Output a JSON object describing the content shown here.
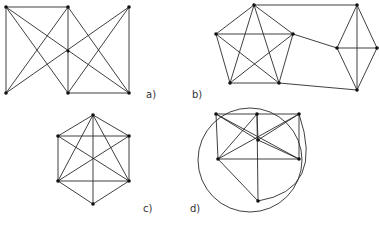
{
  "figure": {
    "panels": [
      {
        "id": "a",
        "label": "a)",
        "label_pos": [
          146,
          98
        ],
        "vertices": [
          [
            6,
            7
          ],
          [
            68,
            7
          ],
          [
            129,
            7
          ],
          [
            6,
            93
          ],
          [
            68,
            93
          ],
          [
            129,
            93
          ]
        ],
        "edges": [
          [
            0,
            1
          ],
          [
            0,
            3
          ],
          [
            0,
            4
          ],
          [
            0,
            5
          ],
          [
            1,
            3
          ],
          [
            1,
            4
          ],
          [
            1,
            5
          ],
          [
            2,
            3
          ],
          [
            2,
            4
          ],
          [
            2,
            5
          ],
          [
            4,
            5
          ]
        ],
        "extra_points": [
          [
            68,
            51
          ]
        ]
      },
      {
        "id": "b",
        "label": "b)",
        "label_pos": [
          192,
          98
        ],
        "vertices": [
          [
            254,
            5
          ],
          [
            216,
            34
          ],
          [
            293,
            34
          ],
          [
            230,
            83
          ],
          [
            279,
            83
          ],
          [
            357,
            5
          ],
          [
            337,
            48
          ],
          [
            377,
            48
          ],
          [
            357,
            90
          ]
        ],
        "edges": [
          [
            0,
            1
          ],
          [
            0,
            2
          ],
          [
            0,
            3
          ],
          [
            0,
            4
          ],
          [
            1,
            2
          ],
          [
            1,
            3
          ],
          [
            1,
            4
          ],
          [
            2,
            3
          ],
          [
            2,
            4
          ],
          [
            3,
            4
          ],
          [
            5,
            6
          ],
          [
            5,
            7
          ],
          [
            5,
            8
          ],
          [
            6,
            7
          ],
          [
            6,
            8
          ],
          [
            7,
            8
          ],
          [
            0,
            5
          ],
          [
            2,
            6
          ],
          [
            4,
            8
          ]
        ]
      },
      {
        "id": "c",
        "label": "c)",
        "label_pos": [
          143,
          212
        ],
        "vertices": [
          [
            93,
            115
          ],
          [
            58,
            136
          ],
          [
            129,
            136
          ],
          [
            58,
            181
          ],
          [
            129,
            181
          ],
          [
            93,
            204
          ]
        ],
        "edges": [
          [
            0,
            1
          ],
          [
            0,
            2
          ],
          [
            0,
            3
          ],
          [
            0,
            4
          ],
          [
            0,
            5
          ],
          [
            1,
            2
          ],
          [
            1,
            3
          ],
          [
            1,
            4
          ],
          [
            2,
            3
          ],
          [
            2,
            4
          ],
          [
            3,
            4
          ],
          [
            3,
            5
          ],
          [
            4,
            5
          ]
        ],
        "extra_points": []
      },
      {
        "id": "d",
        "label": "d)",
        "label_pos": [
          190,
          212
        ],
        "vertices": [
          [
            216,
            114
          ],
          [
            257,
            114
          ],
          [
            299,
            114
          ],
          [
            258,
            140
          ],
          [
            218,
            159
          ],
          [
            299,
            159
          ],
          [
            258,
            201
          ]
        ],
        "edges": [
          [
            0,
            1
          ],
          [
            1,
            2
          ],
          [
            0,
            4
          ],
          [
            0,
            3
          ],
          [
            0,
            5
          ],
          [
            1,
            3
          ],
          [
            1,
            4
          ],
          [
            1,
            6
          ],
          [
            2,
            3
          ],
          [
            2,
            4
          ],
          [
            2,
            5
          ],
          [
            3,
            5
          ],
          [
            4,
            5
          ],
          [
            4,
            6
          ]
        ],
        "circle": {
          "cx": 250,
          "cy": 160,
          "r": 52
        },
        "arc": {
          "from": [
            258,
            201
          ],
          "to": [
            299,
            114
          ],
          "ctrl": [
            325,
            190
          ]
        }
      }
    ]
  }
}
